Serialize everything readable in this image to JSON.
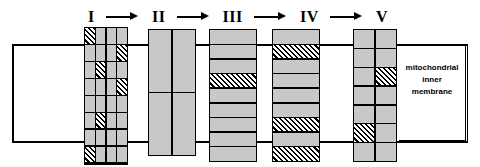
{
  "figure": {
    "membrane_label": {
      "line1": "mitochondrial",
      "line2": "inner",
      "line3": "membrane"
    },
    "colors": {
      "subunit_fill": "#c8c8c8",
      "hatch_stroke": "#000000",
      "outline": "#000000",
      "background": "#ffffff"
    }
  },
  "chain": {
    "arrow_glyph": "→",
    "steps": [
      {
        "label": "I"
      },
      {
        "label": "II"
      },
      {
        "label": "III"
      },
      {
        "label": "IV"
      },
      {
        "label": "V"
      }
    ]
  },
  "complexes": [
    {
      "id": "complex-1",
      "label": "I",
      "columns": 4,
      "rows": 8,
      "cells": [
        "hatch",
        "plain",
        "plain",
        "plain",
        "plain",
        "plain",
        "plain",
        "hatch",
        "plain",
        "hatch",
        "plain",
        "plain",
        "plain",
        "plain",
        "plain",
        "hatch",
        "plain",
        "plain",
        "plain",
        "plain",
        "plain",
        "hatch",
        "plain",
        "plain",
        "plain",
        "plain",
        "plain",
        "plain",
        "hatch",
        "plain",
        "plain",
        "plain",
        "plain",
        "empty",
        "hatch",
        "empty"
      ]
    },
    {
      "id": "complex-2",
      "label": "II",
      "columns": 2,
      "rows": 2,
      "cells": [
        "plain",
        "plain",
        "plain",
        "plain"
      ]
    },
    {
      "id": "complex-3",
      "label": "III",
      "columns": 1,
      "rows": 9,
      "cells": [
        "plain",
        "plain",
        "plain",
        "hatch",
        "plain",
        "plain",
        "plain",
        "plain",
        "plain"
      ]
    },
    {
      "id": "complex-4",
      "label": "IV",
      "columns": 1,
      "rows": 9,
      "cells": [
        "plain",
        "hatch",
        "plain",
        "plain",
        "plain",
        "plain",
        "hatch",
        "plain",
        "hatch"
      ]
    },
    {
      "id": "complex-5",
      "label": "V",
      "columns": 2,
      "rows": 7,
      "cells": [
        "plain",
        "plain",
        "plain",
        "plain",
        "plain",
        "hatch",
        "plain",
        "plain",
        "plain",
        "plain",
        "hatch",
        "plain",
        "plain",
        "plain"
      ]
    }
  ]
}
